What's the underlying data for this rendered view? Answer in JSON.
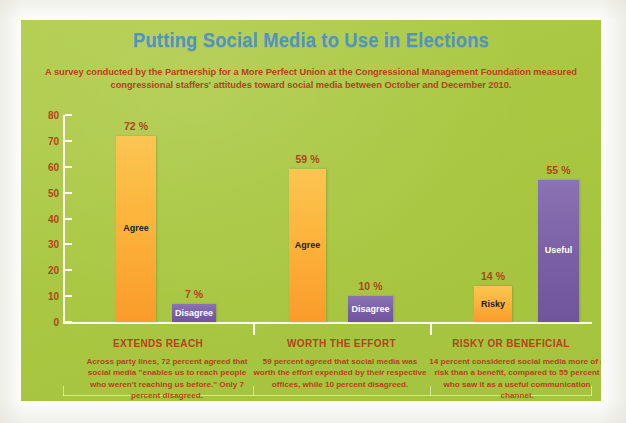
{
  "header": {
    "title": "Putting Social Media to Use in Elections",
    "subtitle": "A survey conducted by the Partnership for a More Perfect Union at the Congressional Management Foundation measured congressional staffers' attitudes toward social media between October and December 2010."
  },
  "colors": {
    "panel_background": "#aac943",
    "title": "#4f93c8",
    "text": "#b4431b",
    "bar_orange": "#fbb03b",
    "bar_purple": "#7a5fa6",
    "axis": "#fbfbf2"
  },
  "chart_data": {
    "type": "bar",
    "title": "Putting Social Media to Use in Elections",
    "xlabel": "",
    "ylabel": "",
    "ylim": [
      0,
      80
    ],
    "yticks": [
      0,
      10,
      20,
      30,
      40,
      50,
      60,
      70,
      80
    ],
    "grid": false,
    "legend": "none",
    "categories": [
      "EXTENDS REACH",
      "WORTH THE EFFORT",
      "RISKY OR BENEFICIAL"
    ],
    "bars": [
      {
        "group": "EXTENDS REACH",
        "label": "Agree",
        "value": 72,
        "value_text": "72 %",
        "color": "#fbb03b",
        "color_name": "orange"
      },
      {
        "group": "EXTENDS REACH",
        "label": "Disagree",
        "value": 7,
        "value_text": "7 %",
        "color": "#7a5fa6",
        "color_name": "purple"
      },
      {
        "group": "WORTH THE EFFORT",
        "label": "Agree",
        "value": 59,
        "value_text": "59 %",
        "color": "#fbb03b",
        "color_name": "orange"
      },
      {
        "group": "WORTH THE EFFORT",
        "label": "Disagree",
        "value": 10,
        "value_text": "10 %",
        "color": "#7a5fa6",
        "color_name": "purple"
      },
      {
        "group": "RISKY OR BENEFICIAL",
        "label": "Risky",
        "value": 14,
        "value_text": "14 %",
        "color": "#fbb03b",
        "color_name": "orange"
      },
      {
        "group": "RISKY OR BENEFICIAL",
        "label": "Useful",
        "value": 55,
        "value_text": "55 %",
        "color": "#7a5fa6",
        "color_name": "purple"
      }
    ],
    "captions": [
      "Across party lines, 72 percent agreed that social media \"enables us to reach people who weren't reaching us before.\" Only 7 percent disagreed.",
      "59 percent agreed that social media was worth the effort expended by their respective offices, while 10 percent disagreed.",
      "14 percent considered social media more of a risk than a benefit, compared to 55 percent who saw it as a useful communication channel."
    ]
  }
}
